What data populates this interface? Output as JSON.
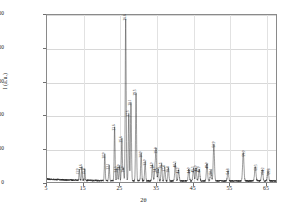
{
  "chart_data": {
    "type": "line",
    "title": "",
    "xlabel": "2θ",
    "ylabel": "I (a.u.)",
    "xlim": [
      5,
      68
    ],
    "ylim": [
      0,
      2500000
    ],
    "xticks": [
      5,
      15,
      25,
      35,
      45,
      55,
      65
    ],
    "yticks": [
      0,
      500000,
      1000000,
      1500000,
      2000000,
      2500000
    ],
    "ytick_labels": [
      "0",
      "500000",
      "1000000",
      "1500000",
      "2000000",
      "2500000"
    ],
    "grid": "horizontal-and-vertical-light",
    "legend": "none",
    "series": [
      {
        "name": "XRD pattern",
        "color": "#222222",
        "baseline": 30000,
        "peaks": [
          {
            "x": 13.9,
            "y": 155000,
            "label": "13.9"
          },
          {
            "x": 14.6,
            "y": 210000,
            "label": "14.6"
          },
          {
            "x": 15.4,
            "y": 160000,
            "label": "15.4"
          },
          {
            "x": 20.9,
            "y": 395000,
            "label": "20.9"
          },
          {
            "x": 22.1,
            "y": 230000,
            "label": "22.1"
          },
          {
            "x": 23.6,
            "y": 800000,
            "label": "23.6"
          },
          {
            "x": 24.3,
            "y": 190000,
            "label": "24.3"
          },
          {
            "x": 24.9,
            "y": 215000,
            "label": "24.9"
          },
          {
            "x": 25.6,
            "y": 630000,
            "label": "25.6"
          },
          {
            "x": 26.0,
            "y": 185000,
            "label": "26.0"
          },
          {
            "x": 26.65,
            "y": 2430000,
            "label": "26.6"
          },
          {
            "x": 27.5,
            "y": 1010000,
            "label": "27.5"
          },
          {
            "x": 28.1,
            "y": 1180000,
            "label": "28.1"
          },
          {
            "x": 29.5,
            "y": 1330000,
            "label": "29.5"
          },
          {
            "x": 30.9,
            "y": 410000,
            "label": "30.9"
          },
          {
            "x": 32.0,
            "y": 290000,
            "label": "32.0"
          },
          {
            "x": 34.0,
            "y": 240000,
            "label": "34.0"
          },
          {
            "x": 34.7,
            "y": 190000,
            "label": "34.7"
          },
          {
            "x": 35.0,
            "y": 470000,
            "label": "35.0"
          },
          {
            "x": 35.6,
            "y": 175000,
            "label": "35.6"
          },
          {
            "x": 36.5,
            "y": 250000,
            "label": "36.5"
          },
          {
            "x": 37.4,
            "y": 195000,
            "label": "37.4"
          },
          {
            "x": 38.4,
            "y": 185000,
            "label": "38.4"
          },
          {
            "x": 40.3,
            "y": 265000,
            "label": "40.3"
          },
          {
            "x": 41.2,
            "y": 165000,
            "label": "41.2"
          },
          {
            "x": 44.0,
            "y": 170000,
            "label": "44.0"
          },
          {
            "x": 45.3,
            "y": 185000,
            "label": "45.3"
          },
          {
            "x": 46.0,
            "y": 195000,
            "label": "46.0"
          },
          {
            "x": 46.9,
            "y": 180000,
            "label": "46.9"
          },
          {
            "x": 49.0,
            "y": 250000,
            "label": "49.0"
          },
          {
            "x": 50.1,
            "y": 160000,
            "label": "50.1"
          },
          {
            "x": 50.9,
            "y": 555000,
            "label": "50.9"
          },
          {
            "x": 54.8,
            "y": 150000,
            "label": "54.8"
          },
          {
            "x": 59.0,
            "y": 420000,
            "label": "59.0"
          },
          {
            "x": 62.3,
            "y": 215000,
            "label": "62.3"
          },
          {
            "x": 64.2,
            "y": 165000,
            "label": "64.2"
          },
          {
            "x": 65.8,
            "y": 150000,
            "label": "65.8"
          }
        ]
      }
    ]
  }
}
